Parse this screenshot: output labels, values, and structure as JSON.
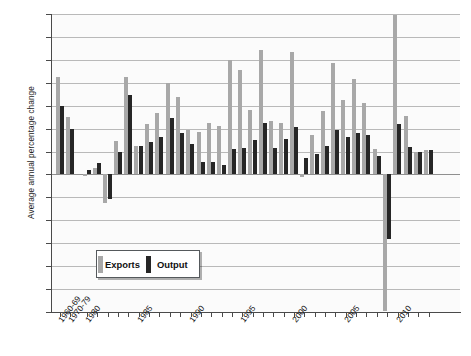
{
  "chart_data": {
    "type": "bar",
    "title": "",
    "subtitle": "",
    "xlabel": "",
    "ylabel": "Average annual percentage change",
    "ylim": [
      -12,
      14
    ],
    "ytick_step": 2,
    "yticks": [
      14,
      12,
      10,
      8,
      6,
      4,
      2,
      0,
      -2,
      -4,
      -6,
      -8,
      -10,
      -12
    ],
    "ytick_labels": [
      "14",
      "12",
      "10",
      "8",
      "6",
      "4",
      "2",
      "0",
      "–2",
      "–4",
      "–6",
      "–8",
      "–10",
      "–12"
    ],
    "grid": true,
    "legend_position": "inside-lower-left",
    "categories": [
      "1960-69",
      "1970-79",
      "1980",
      "1981",
      "1982",
      "1983",
      "1984",
      "1985",
      "1986",
      "1987",
      "1988",
      "1989",
      "1990",
      "1991",
      "1992",
      "1993",
      "1994",
      "1995",
      "1996",
      "1997",
      "1998",
      "1999",
      "2000",
      "2001",
      "2002",
      "2003",
      "2004",
      "2005",
      "2006",
      "2007",
      "2008",
      "2009",
      "2010",
      "2011",
      "2012",
      "2013"
    ],
    "xtick_labels": [
      "1960-69",
      "1970-79",
      "1980",
      "1985",
      "1990",
      "1995",
      "2000",
      "2005",
      "2010"
    ],
    "xtick_label_categories": [
      "1960-69",
      "1970-79",
      "1980",
      "1985",
      "1990",
      "1995",
      "2000",
      "2005",
      "2010"
    ],
    "series": [
      {
        "name": "Exports",
        "color": "#a8a8a8",
        "values": [
          8.5,
          5.0,
          -0.1,
          0.6,
          -2.5,
          2.9,
          8.5,
          2.5,
          4.4,
          5.4,
          8.0,
          6.8,
          3.9,
          3.7,
          4.5,
          4.2,
          10.0,
          9.1,
          5.6,
          10.9,
          4.7,
          4.5,
          10.7,
          -0.2,
          3.4,
          5.5,
          9.7,
          6.5,
          8.3,
          6.2,
          2.2,
          -11.9,
          13.9,
          5.1,
          2.0,
          2.1
        ]
      },
      {
        "name": "Output",
        "color": "#262626",
        "values": [
          6.0,
          4.0,
          0.4,
          1.0,
          -2.1,
          2.0,
          6.9,
          2.5,
          2.8,
          3.3,
          4.9,
          3.6,
          2.7,
          1.1,
          1.1,
          0.8,
          2.2,
          2.3,
          3.0,
          4.5,
          2.35,
          3.1,
          4.1,
          1.4,
          1.8,
          2.5,
          3.9,
          3.25,
          3.65,
          3.4,
          1.6,
          -5.6,
          4.4,
          2.4,
          2.0,
          2.1
        ]
      }
    ]
  },
  "legend": {
    "exports_label": "Exports",
    "output_label": "Output"
  }
}
